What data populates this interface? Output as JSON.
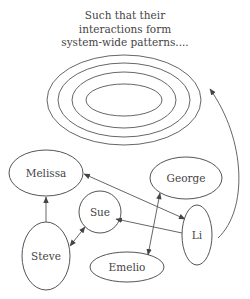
{
  "caption": {
    "lines": [
      "Such that their",
      "interactions form",
      "system-wide patterns...."
    ]
  },
  "pattern": {
    "ring_count": 4,
    "description": "concentric ellipses"
  },
  "nodes": [
    {
      "id": "melissa",
      "label": "Melissa"
    },
    {
      "id": "george",
      "label": "George"
    },
    {
      "id": "sue",
      "label": "Sue"
    },
    {
      "id": "li",
      "label": "Li"
    },
    {
      "id": "steve",
      "label": "Steve"
    },
    {
      "id": "emelio",
      "label": "Emelio"
    }
  ],
  "edges": [
    {
      "from": "steve",
      "to": "melissa",
      "direction": "forward"
    },
    {
      "from": "steve",
      "to": "sue",
      "direction": "both"
    },
    {
      "from": "li",
      "to": "melissa",
      "direction": "both"
    },
    {
      "from": "li",
      "to": "sue",
      "direction": "forward"
    },
    {
      "from": "george",
      "to": "emelio",
      "direction": "both"
    },
    {
      "from": "li",
      "to": "pattern",
      "direction": "forward"
    }
  ]
}
